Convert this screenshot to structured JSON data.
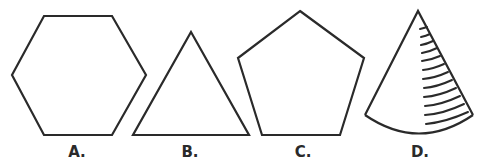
{
  "figures": [
    {
      "id": "A",
      "label": "A.",
      "shape": "hexagon"
    },
    {
      "id": "B",
      "label": "B.",
      "shape": "triangle"
    },
    {
      "id": "C",
      "label": "C.",
      "shape": "pentagon"
    },
    {
      "id": "D",
      "label": "D.",
      "shape": "cone"
    }
  ],
  "colors": {
    "stroke": "#2a2a2a",
    "background": "#ffffff"
  }
}
